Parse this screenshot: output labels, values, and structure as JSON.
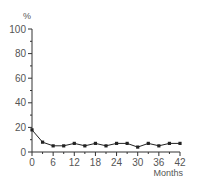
{
  "chart_data": {
    "type": "line",
    "title": "",
    "xlabel": "Months",
    "ylabel": "%",
    "xlim": [
      0,
      42
    ],
    "ylim": [
      0,
      100
    ],
    "x_ticks": [
      0,
      6,
      12,
      18,
      24,
      30,
      36,
      42
    ],
    "x_minor_step": 3,
    "y_ticks": [
      0,
      20,
      40,
      60,
      80,
      100
    ],
    "y_minor_step": 10,
    "grid": false,
    "legend": null,
    "x": [
      0,
      3,
      6,
      9,
      12,
      15,
      18,
      21,
      24,
      27,
      30,
      33,
      36,
      39,
      42
    ],
    "series": [
      {
        "name": "series-1",
        "marker": "square",
        "color": "#222222",
        "values": [
          18,
          8,
          5,
          5,
          7,
          5,
          7,
          5,
          7,
          7,
          4,
          7,
          5,
          7,
          7
        ]
      }
    ]
  },
  "colors": {
    "axis": "#333333",
    "line": "#222222",
    "text": "#555555"
  }
}
